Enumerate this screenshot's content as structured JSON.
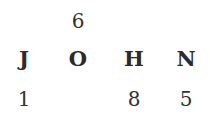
{
  "columns": [
    {
      "letter": "J",
      "top_number": "",
      "bottom_number": "1"
    },
    {
      "letter": "O",
      "top_number": "6",
      "bottom_number": ""
    },
    {
      "letter": "H",
      "top_number": "",
      "bottom_number": "8"
    },
    {
      "letter": "N",
      "top_number": "",
      "bottom_number": "5"
    }
  ],
  "word": "JOHN"
}
